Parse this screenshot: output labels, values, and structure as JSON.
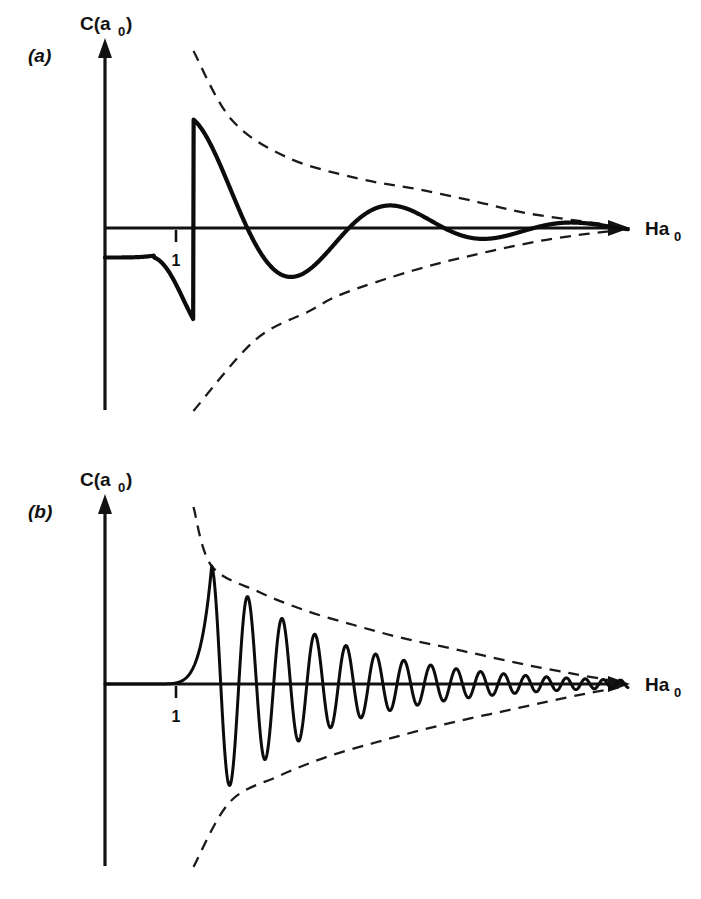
{
  "figure": {
    "background_color": "#ffffff",
    "ink_color": "#111111",
    "width": 701,
    "height": 899,
    "panel_count": 2
  },
  "panels": [
    {
      "id": "a",
      "label": "(a)",
      "label_pos": [
        28,
        62
      ],
      "ylabel": "C(a",
      "ylabel_sub": "0",
      "ylabel_close": ")",
      "xlabel": "Ha",
      "xlabel_sub": "0",
      "tick_label": "1",
      "origin": [
        105,
        228
      ],
      "x_axis_end": 628,
      "y_axis_top": 40,
      "y_axis_bottom": 410,
      "tick_x": 176,
      "curve_stroke_width": 4.2,
      "chart_ref": 0
    },
    {
      "id": "b",
      "label": "(b)",
      "label_pos": [
        28,
        518
      ],
      "ylabel": "C(a",
      "ylabel_sub": "0",
      "ylabel_close": ")",
      "xlabel": "Ha",
      "xlabel_sub": "0",
      "tick_label": "1",
      "origin": [
        105,
        684
      ],
      "x_axis_end": 628,
      "y_axis_top": 496,
      "y_axis_bottom": 866,
      "tick_x": 176,
      "curve_stroke_width": 3.0,
      "chart_ref": 1
    }
  ],
  "chart_data": [
    {
      "type": "line",
      "title": "(a) Weakly damped oscillation of C(a0) versus Ha0",
      "xlabel": "Ha0",
      "ylabel": "C(a0)",
      "xlim": [
        0,
        6.6
      ],
      "ylim": [
        -1.55,
        1.55
      ],
      "grid": false,
      "legend": false,
      "tick_labels_x": [
        "1"
      ],
      "tick_values_x": [
        1
      ],
      "tick_labels_y": [],
      "annotations": [
        "(a)"
      ],
      "series": [
        {
          "name": "C(a0)",
          "style": "solid",
          "role": "oscillation",
          "model": "panel_a_wave",
          "description": "Starts at a negative plateau near C = -0.25 at Ha0 = 0, rises through zero just below Ha0 = 1, peaks at ~+0.92 near Ha0 = 1.6 touching the upper envelope, then oscillates with decaying amplitude and slowly shortening period, converging onto the axis.",
          "start_value": -0.25,
          "zero_crossings": [
            0.93,
            2.43,
            3.52,
            4.38,
            5.05,
            5.58,
            5.98,
            6.28
          ],
          "extrema": [
            {
              "x": 1.6,
              "y": 0.92,
              "kind": "max"
            },
            {
              "x": 3.0,
              "y": -0.56,
              "kind": "min"
            },
            {
              "x": 3.95,
              "y": 0.33,
              "kind": "max"
            },
            {
              "x": 4.72,
              "y": -0.2,
              "kind": "min"
            },
            {
              "x": 5.3,
              "y": 0.12,
              "kind": "max"
            },
            {
              "x": 5.78,
              "y": -0.07,
              "kind": "min"
            },
            {
              "x": 6.12,
              "y": 0.04,
              "kind": "max"
            }
          ]
        },
        {
          "name": "upper envelope",
          "style": "dashed",
          "role": "envelope-upper",
          "description": "Decaying dashed envelope from high left, tangent to each positive peak, asymptotic to the axis.",
          "points": [
            [
              1.12,
              1.5
            ],
            [
              1.6,
              0.92
            ],
            [
              2.3,
              0.6
            ],
            [
              3.2,
              0.42
            ],
            [
              3.95,
              0.33
            ],
            [
              4.72,
              0.22
            ],
            [
              5.3,
              0.13
            ],
            [
              6.0,
              0.06
            ],
            [
              6.5,
              0.02
            ]
          ]
        },
        {
          "name": "lower envelope",
          "style": "dashed",
          "role": "envelope-lower",
          "description": "Mirror dashed envelope from low left, tangent to each negative trough, asymptotic to the axis.",
          "points": [
            [
              1.12,
              -1.55
            ],
            [
              1.9,
              -0.95
            ],
            [
              2.6,
              -0.7
            ],
            [
              3.0,
              -0.56
            ],
            [
              3.9,
              -0.36
            ],
            [
              4.72,
              -0.22
            ],
            [
              5.5,
              -0.11
            ],
            [
              6.1,
              -0.05
            ],
            [
              6.5,
              -0.02
            ]
          ]
        }
      ]
    },
    {
      "type": "line",
      "title": "(b) Rapidly oscillating, slowly damped C(a0) versus Ha0",
      "xlabel": "Ha0",
      "ylabel": "C(a0)",
      "xlim": [
        0,
        6.6
      ],
      "ylim": [
        -1.55,
        1.55
      ],
      "grid": false,
      "legend": false,
      "tick_labels_x": [
        "1"
      ],
      "tick_values_x": [
        1
      ],
      "tick_labels_y": [],
      "annotations": [
        "(b)"
      ],
      "series": [
        {
          "name": "C(a0)",
          "style": "solid",
          "role": "oscillation",
          "model": "panel_b_wave",
          "description": "Begins flat at zero, rises steeply just after Ha0 = 1 to a first peak of ~+1.0, then executes about twelve increasingly rapid oscillations whose amplitude decays, collapsing onto the axis at the right.",
          "start_value": 0.0,
          "first_peak": {
            "x": 1.35,
            "y": 1.0
          },
          "first_trough": {
            "x": 1.58,
            "y": -1.0
          },
          "oscillation_count": 12,
          "peak_amplitudes": [
            1.0,
            0.78,
            0.62,
            0.5,
            0.4,
            0.32,
            0.25,
            0.19,
            0.14,
            0.1,
            0.06,
            0.035
          ]
        },
        {
          "name": "upper envelope",
          "style": "dashed",
          "role": "envelope-upper",
          "description": "Decaying dashed envelope tangent to the positive peaks.",
          "points": [
            [
              1.12,
              1.5
            ],
            [
              1.35,
              1.0
            ],
            [
              1.95,
              0.78
            ],
            [
              2.55,
              0.62
            ],
            [
              3.15,
              0.5
            ],
            [
              3.7,
              0.4
            ],
            [
              4.25,
              0.32
            ],
            [
              4.8,
              0.24
            ],
            [
              5.35,
              0.16
            ],
            [
              5.9,
              0.09
            ],
            [
              6.4,
              0.03
            ]
          ]
        },
        {
          "name": "lower envelope",
          "style": "dashed",
          "role": "envelope-lower",
          "description": "Mirror dashed envelope tangent to the negative troughs.",
          "points": [
            [
              1.12,
              -1.55
            ],
            [
              1.58,
              -1.0
            ],
            [
              2.2,
              -0.78
            ],
            [
              2.8,
              -0.62
            ],
            [
              3.4,
              -0.5
            ],
            [
              3.95,
              -0.4
            ],
            [
              4.5,
              -0.31
            ],
            [
              5.05,
              -0.23
            ],
            [
              5.6,
              -0.15
            ],
            [
              6.1,
              -0.08
            ],
            [
              6.5,
              -0.03
            ]
          ]
        }
      ]
    }
  ]
}
